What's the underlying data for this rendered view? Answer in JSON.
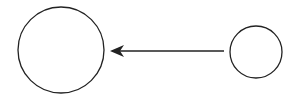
{
  "diagram": {
    "background": "#ffffff",
    "stroke_color": "#222222",
    "nodes": [
      {
        "id": "large-circle",
        "shape": "circle",
        "cx": 61,
        "cy": 50,
        "r": 43
      },
      {
        "id": "small-circle",
        "shape": "circle",
        "cx": 256,
        "cy": 52,
        "r": 26
      }
    ],
    "edges": [
      {
        "from": "small-circle",
        "to": "large-circle",
        "x1": 224,
        "y1": 51,
        "x2": 110,
        "y2": 51,
        "arrowhead": "end"
      }
    ]
  }
}
